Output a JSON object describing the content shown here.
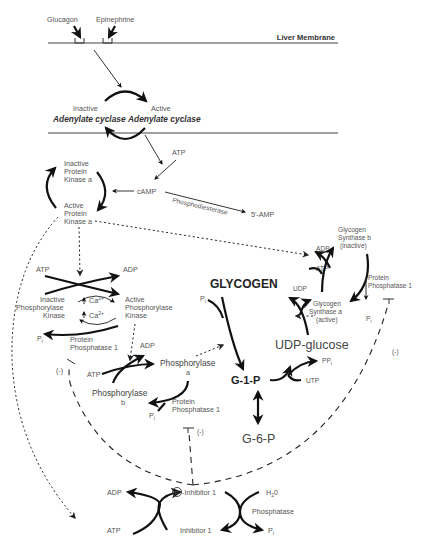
{
  "diagram": {
    "membrane": {
      "label": "Liver Membrane",
      "hormones": [
        "Glucagon",
        "Epinephrine"
      ]
    },
    "adenylate_cyclase": {
      "inactive_state": "Inactive",
      "active_state": "Active",
      "inactive_name": "Adenylate cyclase",
      "active_name": "Adenylate cyclase"
    },
    "camp": {
      "atp": "ATP",
      "camp": "cAMP",
      "enzyme": "Phosphodiesterase",
      "product": "5'-AMP"
    },
    "pka": {
      "inactive": [
        "Inactive",
        "Protein",
        "Kinase a"
      ],
      "active": [
        "Active",
        "Protein",
        "Kinase a"
      ]
    },
    "phosphorylase_kinase": {
      "atp": "ATP",
      "adp": "ADP",
      "inactive": [
        "Inactive",
        "Phosphorylase",
        "Kinase"
      ],
      "active": [
        "Active",
        "Phosphorylase",
        "Kinase"
      ],
      "calcium": "Ca",
      "calcium_charge": "2+",
      "pi": "P",
      "pi_sub": "i",
      "phosphatase": [
        "Protein",
        "Phosphatase 1"
      ]
    },
    "phosphorylase": {
      "atp": "ATP",
      "adp": "ADP",
      "a_name": "Phosphorylase",
      "a_suffix": "a",
      "b_name": "Phosphorylase",
      "b_suffix": "b",
      "pi": "P",
      "pi_sub": "i",
      "phosphatase": [
        "Protein",
        "Phosphatase 1"
      ],
      "inhibit": "(-)"
    },
    "glycogen_synthase": {
      "b": [
        "Glycogen",
        "Synthase b",
        "(inactive)"
      ],
      "a": [
        "Glycogen",
        "Synthase a",
        "(active)"
      ],
      "adp": "ADP",
      "atp": "ATP",
      "phosphatase": [
        "Protein",
        "Phosphatase 1"
      ],
      "pi": "P",
      "pi_sub": "i",
      "inhibit": "(-)"
    },
    "core": {
      "glycogen": "GLYCOGEN",
      "udp_glucose": "UDP-glucose",
      "g1p": "G-1-P",
      "g6p": "G-6-P",
      "udp": "UDP",
      "pi": "P",
      "pi_sub": "i",
      "ppi": "PP",
      "ppi_sub": "i",
      "utp": "UTP"
    },
    "inhibitor": {
      "adp": "ADP",
      "atp": "ATP",
      "p_circle": "P",
      "phospho_inhibitor": "-Inhibitor 1",
      "inhibitor": "Inhibitor 1",
      "h2o": "H",
      "h2o_sub": "2",
      "h2o_end": "0",
      "phosphatase": "Phosphatase",
      "pi": "P",
      "pi_sub": "i",
      "left_inhibit": "(-)"
    }
  }
}
